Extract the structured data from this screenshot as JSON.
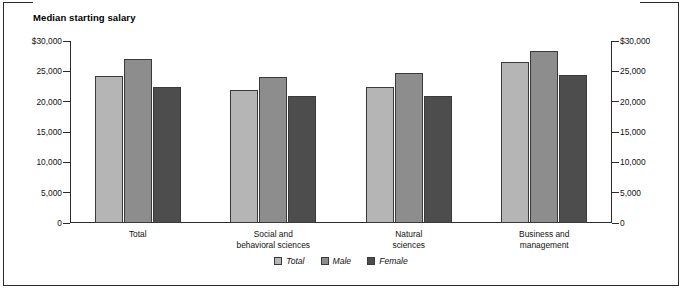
{
  "figure": {
    "title": "Median starting salary"
  },
  "legend": {
    "items": [
      {
        "label": "Total",
        "color": "#b5b5b5"
      },
      {
        "label": "Male",
        "color": "#8d8d8d"
      },
      {
        "label": "Female",
        "color": "#4d4d4d"
      }
    ]
  },
  "axis": {
    "left_ticks": [
      "$30,000",
      "25,000",
      "20,000",
      "15,000",
      "10,000",
      "5,000",
      "0"
    ],
    "right_ticks": [
      "$30,000",
      "25,000",
      "20,000",
      "15,000",
      "10,000",
      "5,000",
      "0"
    ]
  },
  "chart_data": {
    "type": "bar",
    "title": "Median starting salary",
    "xlabel": "",
    "ylabel": "Median starting salary",
    "ylim": [
      0,
      30000
    ],
    "yticks": [
      0,
      5000,
      10000,
      15000,
      20000,
      25000,
      30000
    ],
    "ytick_labels": [
      "0",
      "5,000",
      "10,000",
      "15,000",
      "20,000",
      "25,000",
      "$30,000"
    ],
    "grid": false,
    "legend_position": "bottom-center",
    "categories": [
      "Total",
      "Social and behavioral sciences",
      "Natural sciences",
      "Business and management"
    ],
    "category_label_lines": [
      [
        "Total"
      ],
      [
        "Social and",
        "behavioral sciences"
      ],
      [
        "Natural",
        "sciences"
      ],
      [
        "Business and",
        "management"
      ]
    ],
    "series": [
      {
        "name": "Total",
        "color": "#b5b5b5",
        "values": [
          24200,
          22000,
          22400,
          26500
        ]
      },
      {
        "name": "Male",
        "color": "#8d8d8d",
        "values": [
          27000,
          24000,
          24800,
          28300
        ]
      },
      {
        "name": "Female",
        "color": "#4d4d4d",
        "values": [
          22500,
          21000,
          21000,
          24400
        ]
      }
    ]
  }
}
